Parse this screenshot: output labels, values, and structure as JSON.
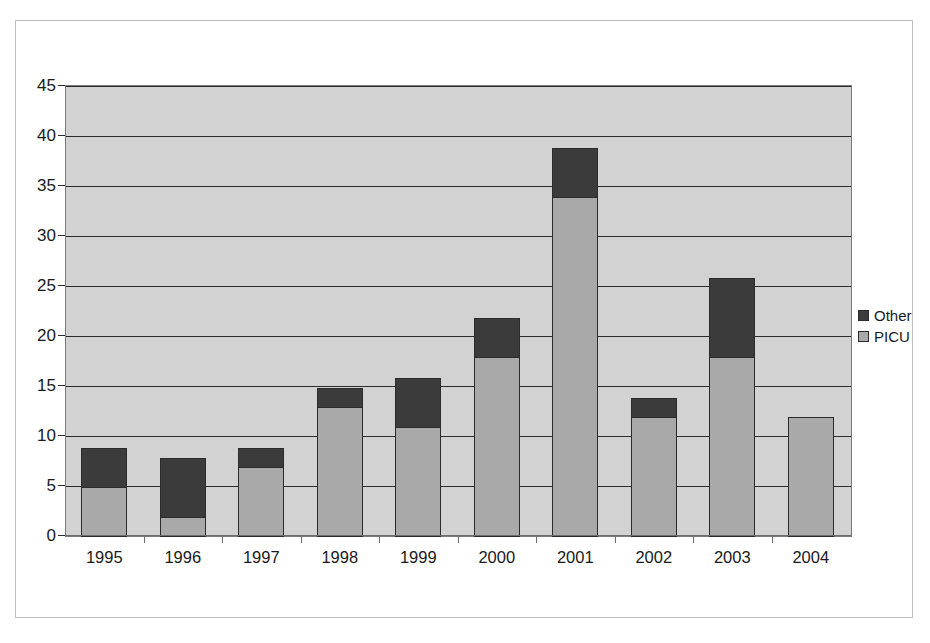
{
  "chart_data": {
    "type": "bar",
    "stacked": true,
    "title": "",
    "xlabel": "",
    "ylabel": "",
    "categories": [
      "1995",
      "1996",
      "1997",
      "1998",
      "1999",
      "2000",
      "2001",
      "2002",
      "2003",
      "2004"
    ],
    "series": [
      {
        "name": "PICU",
        "values": [
          5,
          2,
          7,
          13,
          11,
          18,
          34,
          12,
          18,
          12
        ],
        "color": "#a9a9a9"
      },
      {
        "name": "Other",
        "values": [
          4,
          6,
          2,
          2,
          5,
          4,
          5,
          2,
          8,
          0
        ],
        "color": "#3b3b3b"
      }
    ],
    "totals": [
      9,
      8,
      9,
      15,
      16,
      22,
      39,
      14,
      26,
      12
    ],
    "ylim": [
      0,
      45
    ],
    "ytick_labels": [
      "0",
      "5",
      "10",
      "15",
      "20",
      "25",
      "30",
      "35",
      "40",
      "45"
    ],
    "ytick_values": [
      0,
      5,
      10,
      15,
      20,
      25,
      30,
      35,
      40,
      45
    ],
    "grid": true,
    "legend_position": "right",
    "legend_entries": [
      {
        "label": "Other",
        "color": "#3b3b3b"
      },
      {
        "label": "PICU",
        "color": "#a9a9a9"
      }
    ],
    "plot_background": "#d2d2d2",
    "gridline_color": "#2b2b2b",
    "figure_background": "#ffffff"
  }
}
